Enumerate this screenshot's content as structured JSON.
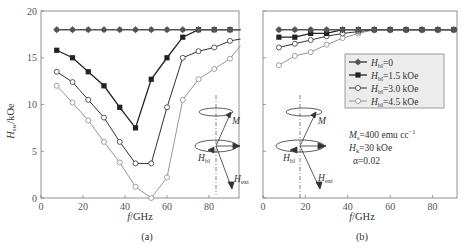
{
  "figure": {
    "panel_a_caption": "(a)",
    "panel_b_caption": "(b)",
    "xlabel_italic": "f",
    "xlabel_unit": "/GHz",
    "ylabel_main": "H",
    "ylabel_sub": "sw",
    "ylabel_unit": "/kOe"
  },
  "legend": [
    {
      "name_main": "H",
      "name_sub": "bl",
      "value": "=0",
      "marker": "filled-circle",
      "color": "#555555"
    },
    {
      "name_main": "H",
      "name_sub": "bl",
      "value": "=1.5 kOe",
      "marker": "filled-square",
      "color": "#222222"
    },
    {
      "name_main": "H",
      "name_sub": "bl",
      "value": "=3.0 kOe",
      "marker": "open-circle",
      "color": "#333333"
    },
    {
      "name_main": "H",
      "name_sub": "bl",
      "value": "=4.5 kOe",
      "marker": "open-circle",
      "color": "#888888"
    }
  ],
  "annotations": {
    "ms": "Mₛ=400 emu cc⁻¹",
    "ms_main": "M",
    "ms_sub": "s",
    "ms_val": "=400 emu cc",
    "ms_exp": "−1",
    "hk_main": "H",
    "hk_sub": "k",
    "hk_val": "=30 kOe",
    "alpha": "α=0.02",
    "diagram_M": "M",
    "diagram_Hbl_main": "H",
    "diagram_Hbl_sub": "bl",
    "diagram_Hext_main": "H",
    "diagram_Hext_sub": "ext"
  },
  "chart_data": [
    {
      "type": "line",
      "title": "(a)",
      "xlabel": "f/GHz",
      "ylabel": "H_sw/kOe",
      "xlim": [
        0,
        95
      ],
      "ylim": [
        0,
        20
      ],
      "xticks": [
        0,
        20,
        40,
        60,
        80
      ],
      "yticks": [
        0,
        5,
        10,
        15,
        20
      ],
      "grid": false,
      "x": [
        7.5,
        15,
        22.5,
        30,
        37.5,
        45,
        52.5,
        60,
        67.5,
        75,
        82.5,
        90,
        95
      ],
      "series": [
        {
          "name": "H_bl=0",
          "values": [
            18,
            18,
            18,
            18,
            18,
            18,
            18,
            18,
            18,
            18,
            18,
            18,
            18
          ]
        },
        {
          "name": "H_bl=1.5 kOe",
          "values": [
            15.8,
            15.0,
            13.5,
            12.0,
            9.7,
            7.5,
            12.7,
            15.0,
            17.2,
            18.0,
            18.0,
            18.0,
            18.0
          ]
        },
        {
          "name": "H_bl=3.0 kOe",
          "values": [
            13.5,
            12.4,
            10.5,
            8.6,
            6.0,
            3.7,
            3.7,
            9.7,
            15.0,
            15.7,
            16.1,
            16.8,
            17.0
          ]
        },
        {
          "name": "H_bl=4.5 kOe",
          "values": [
            12.0,
            10.2,
            8.3,
            6.0,
            3.8,
            1.2,
            0.0,
            2.2,
            10.5,
            12.7,
            13.8,
            14.9,
            16.3
          ]
        }
      ]
    },
    {
      "type": "line",
      "title": "(b)",
      "xlabel": "f/GHz",
      "ylabel": "H_sw/kOe",
      "xlim": [
        0,
        92
      ],
      "ylim": [
        0,
        20
      ],
      "xticks": [
        0,
        20,
        40,
        60,
        80
      ],
      "grid": false,
      "legend_position": "upper right (inside)",
      "x": [
        7.5,
        15,
        22.5,
        30,
        37.5,
        45,
        52.5,
        60,
        67.5,
        75,
        82.5,
        90
      ],
      "series": [
        {
          "name": "H_bl=0",
          "values": [
            18,
            18,
            18,
            18,
            18,
            18,
            18,
            18,
            18,
            18,
            18,
            18
          ]
        },
        {
          "name": "H_bl=1.5 kOe",
          "values": [
            17.2,
            17.2,
            17.6,
            17.6,
            18,
            18,
            18,
            18,
            18,
            18,
            18,
            18
          ]
        },
        {
          "name": "H_bl=3.0 kOe",
          "values": [
            16.1,
            16.5,
            16.9,
            17.3,
            17.6,
            17.8,
            18,
            18,
            18,
            18,
            18,
            18
          ]
        },
        {
          "name": "H_bl=4.5 kOe",
          "values": [
            14.2,
            15.2,
            15.6,
            16.4,
            17.1,
            17.6,
            18,
            18,
            18,
            18,
            18,
            18
          ]
        }
      ]
    }
  ]
}
